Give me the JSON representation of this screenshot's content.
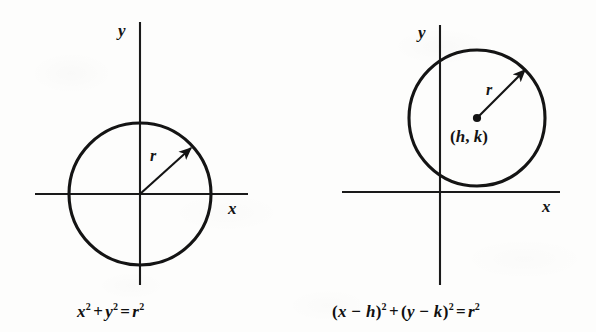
{
  "figure": {
    "background_color": "#fdfdfc",
    "ink_color": "#141414"
  },
  "panels": [
    {
      "id": "circle-at-origin",
      "axis_x_label": "x",
      "axis_y_label": "y",
      "radius_label": "r",
      "center_label": "",
      "caption": {
        "full_text": "x² + y² = r²",
        "tokens": [
          {
            "base": "x",
            "sup": "2",
            "italic": true
          },
          {
            "base": "+",
            "sup": "",
            "italic": false
          },
          {
            "base": "y",
            "sup": "2",
            "italic": true
          },
          {
            "base": "=",
            "sup": "",
            "italic": false
          },
          {
            "base": "r",
            "sup": "2",
            "italic": true
          }
        ]
      },
      "geometry": {
        "origin_x": 140,
        "origin_y": 194,
        "circle_center_x": 140,
        "circle_center_y": 194,
        "circle_radius": 71,
        "x_axis_start": 35,
        "x_axis_end": 248,
        "y_axis_start": 22,
        "y_axis_end": 285,
        "radius_arrow_angle_deg": 42,
        "has_center_dot": false
      }
    },
    {
      "id": "circle-at-h-k",
      "axis_x_label": "x",
      "axis_y_label": "y",
      "radius_label": "r",
      "center_label_open": "(",
      "center_label_h": "h",
      "center_label_comma": ", ",
      "center_label_k": "k",
      "center_label_close": ")",
      "caption": {
        "full_text": "(x − h)² + (y − k)² = r²",
        "tokens": [
          {
            "base": "(x − h)",
            "sup": "2",
            "italic": true
          },
          {
            "base": "+",
            "sup": "",
            "italic": false
          },
          {
            "base": "(y − k)",
            "sup": "2",
            "italic": true
          },
          {
            "base": "=",
            "sup": "",
            "italic": false
          },
          {
            "base": "r",
            "sup": "2",
            "italic": true
          }
        ]
      },
      "geometry": {
        "origin_x": 440,
        "origin_y": 192,
        "circle_center_x": 477,
        "circle_center_y": 118,
        "circle_radius": 68,
        "x_axis_start": 342,
        "x_axis_end": 560,
        "y_axis_start": 25,
        "y_axis_end": 285,
        "radius_arrow_angle_deg": 45,
        "has_center_dot": true
      }
    }
  ]
}
